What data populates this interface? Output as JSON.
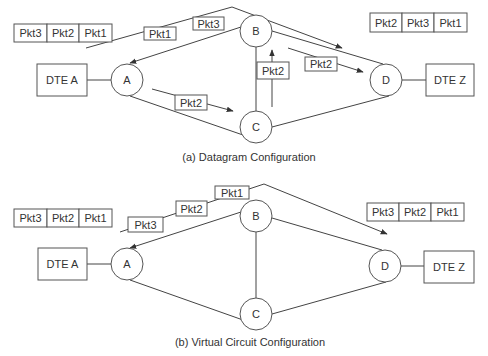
{
  "diagrams": [
    {
      "id": "datagram",
      "caption": "(a) Datagram Configuration",
      "source_queue": [
        "Pkt3",
        "Pkt2",
        "Pkt1"
      ],
      "destination_queue": [
        "Pkt2",
        "Pkt3",
        "Pkt1"
      ],
      "dte_source": "DTE A",
      "dte_destination": "DTE Z",
      "nodes": {
        "a": "A",
        "b": "B",
        "c": "C",
        "d": "D"
      },
      "in_transit": {
        "upper_path_1": "Pkt1",
        "upper_path_2": "Pkt3",
        "a_to_c": "Pkt2",
        "c_to_b": "Pkt2",
        "b_to_d": "Pkt2"
      }
    },
    {
      "id": "virtual-circuit",
      "caption": "(b) Virtual Circuit Configuration",
      "source_queue": [
        "Pkt3",
        "Pkt2",
        "Pkt1"
      ],
      "destination_queue": [
        "Pkt3",
        "Pkt2",
        "Pkt1"
      ],
      "dte_source": "DTE A",
      "dte_destination": "DTE Z",
      "nodes": {
        "a": "A",
        "b": "B",
        "c": "C",
        "d": "D"
      },
      "in_transit": {
        "path_1": "Pkt3",
        "path_2": "Pkt2",
        "path_3": "Pkt1"
      }
    }
  ]
}
